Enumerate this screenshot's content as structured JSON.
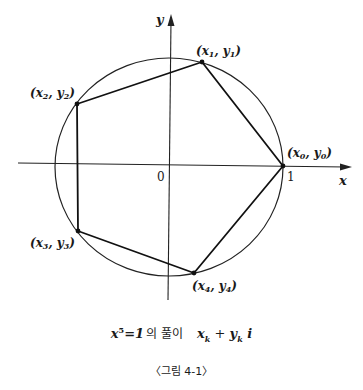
{
  "figure": {
    "axes": {
      "x_label": "x",
      "y_label": "y",
      "origin_label": "0",
      "unit_label": "1"
    },
    "points": [
      {
        "label_x": "x",
        "label_y": "y",
        "sub": "0",
        "cx": 283,
        "cy": 166
      },
      {
        "label_x": "x",
        "label_y": "y",
        "sub": "1",
        "cx": 202,
        "cy": 62
      },
      {
        "label_x": "x",
        "label_y": "y",
        "sub": "2",
        "cx": 77,
        "cy": 104
      },
      {
        "label_x": "x",
        "label_y": "y",
        "sub": "3",
        "cx": 78,
        "cy": 231
      },
      {
        "label_x": "x",
        "label_y": "y",
        "sub": "4",
        "cx": 194,
        "cy": 273
      }
    ],
    "caption": {
      "lhs": "x",
      "exp": "5",
      "eq": "=1",
      "korean": "의 풀이",
      "rhs_x": "x",
      "rhs_sub1": "k",
      "rhs_plus": " + ",
      "rhs_y": "y",
      "rhs_sub2": "k",
      "rhs_i": " i"
    },
    "figure_number": "〈그림 4-1〉"
  }
}
